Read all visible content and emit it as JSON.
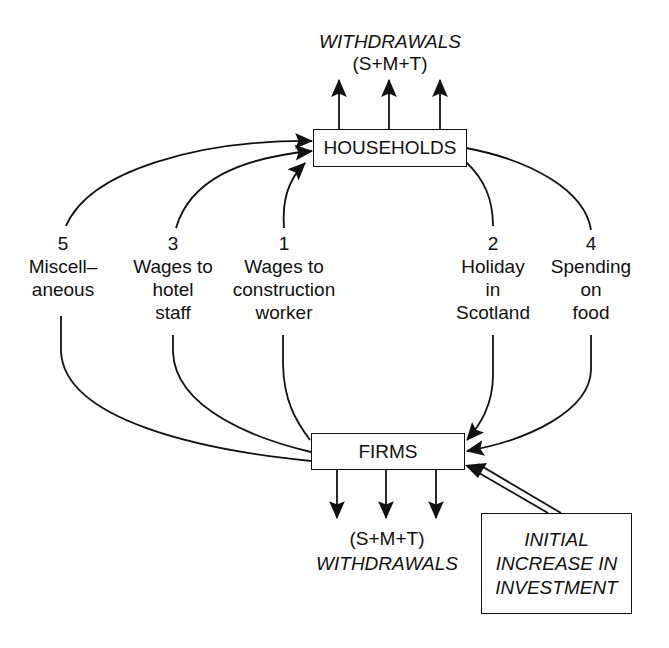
{
  "diagram": {
    "type": "circular-flow / multiplier diagram",
    "top_withdrawals": {
      "title": "WITHDRAWALS",
      "formula": "(S+M+T)"
    },
    "bottom_withdrawals": {
      "formula": "(S+M+T)",
      "title": "WITHDRAWALS"
    },
    "nodes": {
      "households": "HOUSEHOLDS",
      "firms": "FIRMS",
      "injection": [
        "INITIAL",
        "INCREASE IN",
        "INVESTMENT"
      ]
    },
    "flows": [
      {
        "number": "5",
        "lines": [
          "Miscell–",
          "aneous"
        ],
        "direction": "firms-to-households"
      },
      {
        "number": "3",
        "lines": [
          "Wages to",
          "hotel",
          "staff"
        ],
        "direction": "firms-to-households"
      },
      {
        "number": "1",
        "lines": [
          "Wages to",
          "construction",
          "worker"
        ],
        "direction": "firms-to-households"
      },
      {
        "number": "2",
        "lines": [
          "Holiday",
          "in",
          "Scotland"
        ],
        "direction": "households-to-firms"
      },
      {
        "number": "4",
        "lines": [
          "Spending",
          "on",
          "food"
        ],
        "direction": "households-to-firms"
      }
    ],
    "colors": {
      "ink": "#111111",
      "background": "#ffffff"
    }
  }
}
